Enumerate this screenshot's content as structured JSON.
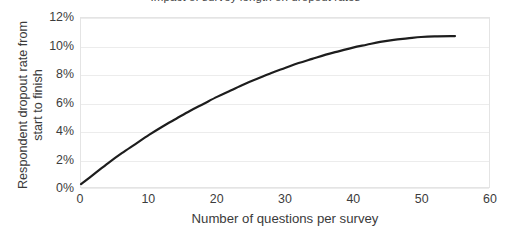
{
  "chart_data": {
    "type": "line",
    "title": "Impact of survey length on dropout rates",
    "title_clipped": true,
    "xlabel": "Number of questions per survey",
    "ylabel_line1": "Respondent dropout rate from",
    "ylabel_line2": "start to finish",
    "xlim": [
      0,
      60
    ],
    "ylim": [
      0,
      12
    ],
    "x_tick_labels": [
      "0",
      "10",
      "20",
      "30",
      "40",
      "50",
      "60"
    ],
    "x_tick_values": [
      0,
      10,
      20,
      30,
      40,
      50,
      60
    ],
    "y_tick_labels": [
      "0%",
      "2%",
      "4%",
      "6%",
      "8%",
      "10%",
      "12%"
    ],
    "y_tick_values": [
      0,
      2,
      4,
      6,
      8,
      10,
      12
    ],
    "grid": "horizontal",
    "legend": "none",
    "series": [
      {
        "name": "Dropout rate",
        "color": "#1d1d1d",
        "line_width": 2.2,
        "x": [
          0,
          2,
          4,
          6,
          8,
          10,
          12,
          14,
          16,
          18,
          20,
          22,
          24,
          26,
          28,
          30,
          32,
          34,
          36,
          38,
          40,
          42,
          44,
          46,
          48,
          50,
          52,
          55
        ],
        "y": [
          0.2,
          0.95,
          1.7,
          2.4,
          3.05,
          3.7,
          4.3,
          4.85,
          5.4,
          5.9,
          6.4,
          6.85,
          7.3,
          7.7,
          8.1,
          8.45,
          8.8,
          9.1,
          9.4,
          9.65,
          9.9,
          10.1,
          10.3,
          10.45,
          10.55,
          10.65,
          10.7,
          10.72
        ]
      }
    ]
  }
}
